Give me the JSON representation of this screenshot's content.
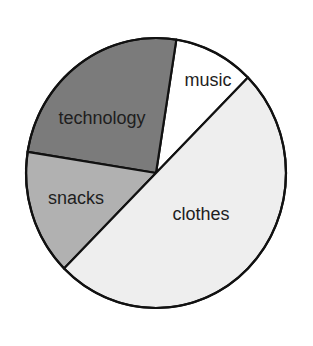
{
  "chart_data": {
    "type": "pie",
    "title": "",
    "categories": [
      "music",
      "technology",
      "snacks",
      "clothes"
    ],
    "values": [
      10,
      25,
      15,
      50
    ],
    "unit": "%",
    "colors": [
      "#ffffff",
      "#7b7b7b",
      "#b1b1b1",
      "#eeeeee"
    ],
    "start_angle_deg": 45,
    "direction": "counterclockwise",
    "legend": "none",
    "labels_inside": true
  },
  "layout": {
    "cx": 156,
    "cy": 173,
    "rx": 130,
    "ry": 135,
    "stroke": "#111111",
    "stroke_width": 2.2,
    "label_positions": [
      {
        "x": 208,
        "y": 86
      },
      {
        "x": 102,
        "y": 124
      },
      {
        "x": 76,
        "y": 204
      },
      {
        "x": 201,
        "y": 220
      }
    ]
  }
}
